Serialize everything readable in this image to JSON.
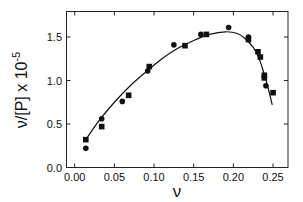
{
  "chart_data": {
    "type": "scatter",
    "title": "",
    "xlabel": "ν",
    "ylabel": "ν/[P] x 10",
    "ylabel_exponent": "-5",
    "xlim": [
      -0.01,
      0.265
    ],
    "ylim": [
      0.0,
      1.8
    ],
    "xticks": [
      0.0,
      0.05,
      0.1,
      0.15,
      0.2,
      0.25
    ],
    "xtick_labels": [
      "0.00",
      "0.05",
      "0.10",
      "0.15",
      "0.20",
      "0.25"
    ],
    "yticks": [
      0.0,
      0.5,
      1.0,
      1.5
    ],
    "ytick_labels": [
      "0.0",
      "0.5",
      "1.0",
      "1.5"
    ],
    "grid": false,
    "legend": null,
    "series": [
      {
        "name": "circles",
        "marker": "circle",
        "color": "#111111",
        "x": [
          0.014,
          0.034,
          0.06,
          0.092,
          0.125,
          0.159,
          0.194,
          0.219,
          0.241
        ],
        "y": [
          0.22,
          0.56,
          0.76,
          1.11,
          1.41,
          1.53,
          1.61,
          1.5,
          0.94
        ]
      },
      {
        "name": "squares",
        "marker": "square",
        "color": "#111111",
        "x": [
          0.014,
          0.034,
          0.068,
          0.094,
          0.139,
          0.166,
          0.219,
          0.231,
          0.234,
          0.239,
          0.239,
          0.25
        ],
        "y": [
          0.32,
          0.47,
          0.83,
          1.16,
          1.4,
          1.53,
          1.47,
          1.33,
          1.27,
          1.06,
          1.03,
          0.86
        ]
      },
      {
        "name": "fit",
        "marker": "line",
        "color": "#111111",
        "x": [
          0.014,
          0.03,
          0.05,
          0.07,
          0.09,
          0.11,
          0.13,
          0.15,
          0.17,
          0.19,
          0.205,
          0.215,
          0.225,
          0.232,
          0.238,
          0.243,
          0.249
        ],
        "y": [
          0.32,
          0.53,
          0.75,
          0.94,
          1.1,
          1.25,
          1.37,
          1.46,
          1.53,
          1.56,
          1.54,
          1.48,
          1.38,
          1.26,
          1.1,
          0.94,
          0.72
        ]
      }
    ]
  }
}
